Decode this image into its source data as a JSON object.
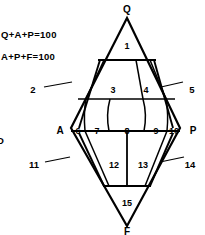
{
  "diagram": {
    "type": "qapf-double-triangle",
    "equations": [
      "Q+A+P=100",
      "A+P+F=100"
    ],
    "partial_left_glyph": "D",
    "vertices": [
      {
        "id": "Q",
        "label": "Q",
        "position": "top"
      },
      {
        "id": "A",
        "label": "A",
        "position": "left"
      },
      {
        "id": "P",
        "label": "P",
        "position": "right"
      },
      {
        "id": "F",
        "label": "F",
        "position": "bottom"
      }
    ],
    "fields": [
      {
        "n": "1",
        "x": 127,
        "y": 49,
        "callout": false
      },
      {
        "n": "2",
        "x": 33,
        "y": 90,
        "callout": true,
        "line": [
          44,
          87,
          72,
          82
        ]
      },
      {
        "n": "3",
        "x": 113,
        "y": 90,
        "callout": false
      },
      {
        "n": "4",
        "x": 146,
        "y": 90,
        "callout": false
      },
      {
        "n": "5",
        "x": 192,
        "y": 90,
        "callout": true,
        "line": [
          161,
          87,
          183,
          82
        ]
      },
      {
        "n": "6",
        "x": 78,
        "y": 131,
        "callout": false
      },
      {
        "n": "7",
        "x": 97,
        "y": 131,
        "callout": false
      },
      {
        "n": "8",
        "x": 127,
        "y": 131,
        "callout": false
      },
      {
        "n": "9",
        "x": 157,
        "y": 131,
        "callout": false
      },
      {
        "n": "10",
        "x": 174,
        "y": 131,
        "callout": false
      },
      {
        "n": "11",
        "x": 34,
        "y": 165,
        "callout": true,
        "line": [
          45,
          162,
          70,
          157
        ]
      },
      {
        "n": "12",
        "x": 114,
        "y": 165,
        "callout": false
      },
      {
        "n": "13",
        "x": 143,
        "y": 165,
        "callout": false
      },
      {
        "n": "14",
        "x": 190,
        "y": 165,
        "callout": true,
        "line": [
          160,
          162,
          184,
          157
        ]
      },
      {
        "n": "15",
        "x": 127,
        "y": 203,
        "callout": false
      }
    ],
    "colors": {
      "line": "#000000",
      "background": "#ffffff",
      "text": "#000000"
    }
  }
}
